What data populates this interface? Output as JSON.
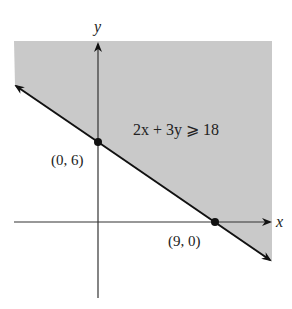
{
  "diagram": {
    "inequality": "2x + 3y ⩾ 18",
    "axes": {
      "x_label": "x",
      "y_label": "y"
    },
    "points": [
      {
        "label": "(0, 6)",
        "x": 0,
        "y": 6
      },
      {
        "label": "(9, 0)",
        "x": 9,
        "y": 0
      }
    ],
    "boundary_line": "2x + 3y = 18",
    "shaded_region": "above/right of boundary line",
    "colors": {
      "shade": "#c9c9c9",
      "line": "#111111",
      "axis": "#333333"
    }
  }
}
